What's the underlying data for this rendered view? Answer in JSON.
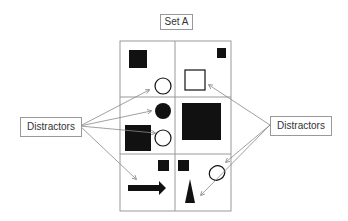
{
  "title": "Set A",
  "labels": {
    "left": "Distractors",
    "right": "Distractors"
  },
  "grid": {
    "rows": 3,
    "cols": 2
  },
  "cells": [
    {
      "row": 0,
      "col": 0,
      "shapes": [
        "filled-square",
        "outline-circle"
      ]
    },
    {
      "row": 0,
      "col": 1,
      "shapes": [
        "small-filled-square",
        "outline-square"
      ]
    },
    {
      "row": 1,
      "col": 0,
      "shapes": [
        "filled-circle",
        "filled-square",
        "outline-circle"
      ]
    },
    {
      "row": 1,
      "col": 1,
      "shapes": [
        "large-filled-square"
      ]
    },
    {
      "row": 2,
      "col": 0,
      "shapes": [
        "small-filled-square",
        "arrow"
      ]
    },
    {
      "row": 2,
      "col": 1,
      "shapes": [
        "small-filled-square",
        "outline-circle",
        "triangle"
      ]
    }
  ],
  "colors": {
    "shape": "#111111",
    "line": "#999999",
    "arrow": "#888888"
  }
}
